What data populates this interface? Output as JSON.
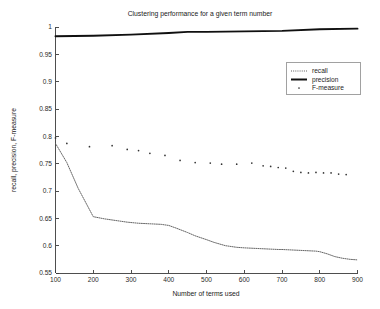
{
  "chart_data": {
    "type": "line",
    "title": "Clustering performance for a given term number",
    "xlabel": "Number of terms used",
    "ylabel": "recall, precision, F-measure",
    "xlim": [
      100,
      900
    ],
    "ylim": [
      0.55,
      1.0
    ],
    "grid": false,
    "legend_position": "upper right",
    "xticks": [
      100,
      200,
      300,
      400,
      500,
      600,
      700,
      800,
      900
    ],
    "xtick_labels": [
      "100",
      "200",
      "300",
      "400",
      "500",
      "600",
      "700",
      "800",
      "900"
    ],
    "yticks": [
      0.55,
      0.6,
      0.65,
      0.7,
      0.75,
      0.8,
      0.85,
      0.9,
      0.95,
      1
    ],
    "ytick_labels": [
      "0.55",
      "0.6",
      "0.65",
      "0.7",
      "0.75",
      "0.8",
      "0.85",
      "0.9",
      "0.95",
      "1"
    ],
    "series": [
      {
        "name": "recall",
        "style": "dotted-line",
        "color": "#5e5e5e",
        "x": [
          100,
          130,
          160,
          200,
          230,
          260,
          290,
          320,
          350,
          380,
          400,
          420,
          450,
          470,
          500,
          520,
          550,
          580,
          600,
          630,
          660,
          690,
          700,
          730,
          760,
          790,
          800,
          820,
          840,
          860,
          880,
          900
        ],
        "values": [
          0.787,
          0.752,
          0.705,
          0.653,
          0.649,
          0.646,
          0.643,
          0.641,
          0.64,
          0.639,
          0.637,
          0.632,
          0.624,
          0.618,
          0.611,
          0.606,
          0.6,
          0.597,
          0.596,
          0.595,
          0.594,
          0.593,
          0.593,
          0.592,
          0.591,
          0.59,
          0.589,
          0.585,
          0.58,
          0.577,
          0.575,
          0.574
        ]
      },
      {
        "name": "precision",
        "style": "solid-line",
        "color": "#101010",
        "x": [
          100,
          200,
          300,
          400,
          450,
          500,
          600,
          700,
          800,
          900
        ],
        "values": [
          0.983,
          0.984,
          0.986,
          0.989,
          0.991,
          0.991,
          0.992,
          0.993,
          0.996,
          0.997
        ]
      },
      {
        "name": "F-measure",
        "style": "dot-markers",
        "color": "#333333",
        "x": [
          100,
          130,
          190,
          250,
          290,
          320,
          350,
          390,
          430,
          470,
          510,
          540,
          580,
          620,
          650,
          670,
          690,
          710,
          730,
          750,
          770,
          790,
          810,
          830,
          850,
          870
        ],
        "values": [
          0.797,
          0.787,
          0.781,
          0.783,
          0.776,
          0.774,
          0.769,
          0.765,
          0.756,
          0.752,
          0.751,
          0.749,
          0.749,
          0.751,
          0.746,
          0.745,
          0.743,
          0.742,
          0.736,
          0.734,
          0.733,
          0.734,
          0.733,
          0.733,
          0.731,
          0.73
        ]
      }
    ]
  },
  "legend": {
    "entries": [
      {
        "label": "recall"
      },
      {
        "label": "precision"
      },
      {
        "label": "F-measure"
      }
    ]
  }
}
